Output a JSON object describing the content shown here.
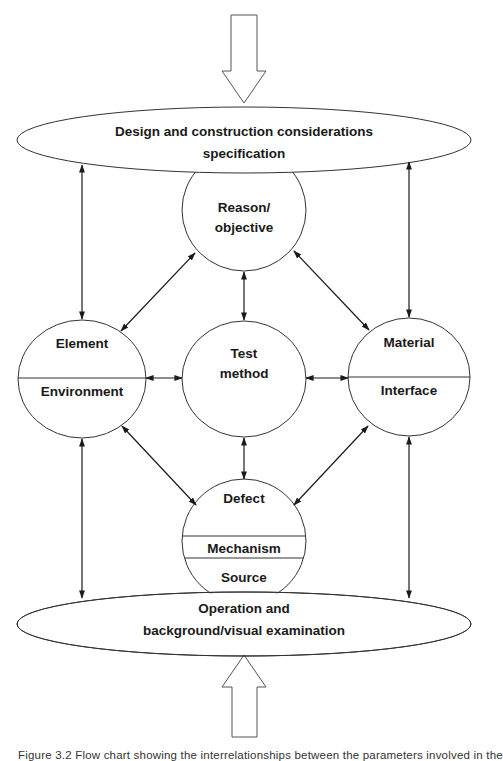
{
  "diagram": {
    "input_arrow": {
      "direction": "down",
      "label": "input-arrow"
    },
    "output_arrow": {
      "direction": "up",
      "label": "feedback-arrow"
    },
    "top_ellipse": {
      "line1": "Design and construction considerations",
      "line2": "specification"
    },
    "bottom_ellipse": {
      "line1": "Operation and",
      "line2": "background/visual examination"
    },
    "nodes": {
      "reason": {
        "line1": "Reason/",
        "line2": "objective"
      },
      "element": {
        "top": "Element",
        "bottom": "Environment"
      },
      "test": {
        "line1": "Test",
        "line2": "method"
      },
      "material": {
        "top": "Material",
        "bottom": "Interface"
      },
      "defect": {
        "top": "Defect",
        "middle": "Mechanism",
        "bottom": "Source"
      }
    },
    "connections": [
      {
        "from": "top_ellipse",
        "to": "element",
        "type": "bidirectional"
      },
      {
        "from": "top_ellipse",
        "to": "material",
        "type": "bidirectional"
      },
      {
        "from": "reason",
        "to": "element",
        "type": "bidirectional"
      },
      {
        "from": "reason",
        "to": "material",
        "type": "bidirectional"
      },
      {
        "from": "reason",
        "to": "test",
        "type": "bidirectional"
      },
      {
        "from": "element",
        "to": "test",
        "type": "bidirectional"
      },
      {
        "from": "material",
        "to": "test",
        "type": "bidirectional"
      },
      {
        "from": "test",
        "to": "defect",
        "type": "bidirectional"
      },
      {
        "from": "element",
        "to": "defect",
        "type": "bidirectional"
      },
      {
        "from": "material",
        "to": "defect",
        "type": "bidirectional"
      },
      {
        "from": "element",
        "to": "bottom_ellipse",
        "type": "bidirectional"
      },
      {
        "from": "material",
        "to": "bottom_ellipse",
        "type": "bidirectional"
      }
    ],
    "stroke_color": "#333333",
    "arrow_color": "#1a1a1a"
  },
  "caption": "Figure 3.2   Flow chart showing the interrelationships between the parameters involved in the"
}
